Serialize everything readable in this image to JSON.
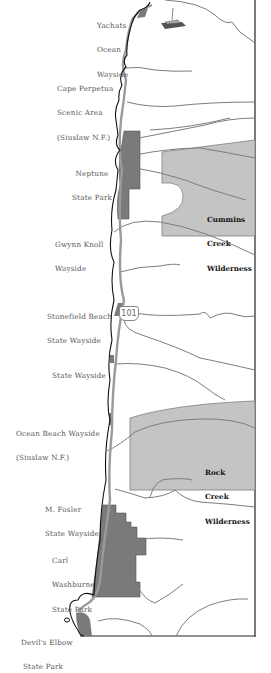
{
  "map": {
    "highway": {
      "route_number": "101"
    },
    "wilderness_areas": [
      {
        "name": "Cummins Creek Wilderness",
        "lines": [
          "Cummins",
          "Creek",
          "Wilderness"
        ]
      },
      {
        "name": "Rock Creek Wilderness",
        "lines": [
          "Rock",
          "Creek",
          "Wilderness"
        ]
      }
    ],
    "labels": [
      {
        "id": "yachats",
        "lines": [
          "Yachats",
          "Ocean",
          "Wayside"
        ]
      },
      {
        "id": "cape-perpetua",
        "lines": [
          "Cape Perpetua",
          "Scenic Area",
          "(Siuslaw N.F.)"
        ]
      },
      {
        "id": "neptune",
        "lines": [
          "Neptune",
          "State Park"
        ]
      },
      {
        "id": "gwynn-knoll",
        "lines": [
          "Gwynn Knoll",
          "Wayside"
        ]
      },
      {
        "id": "stonefield",
        "lines": [
          "Stonefield Beach",
          "State Wayside"
        ]
      },
      {
        "id": "state-wayside",
        "lines": [
          "State Wayside"
        ]
      },
      {
        "id": "ocean-beach",
        "lines": [
          "Ocean Beach Wayside",
          "(Siuslaw N.F.)"
        ]
      },
      {
        "id": "m-fosler",
        "lines": [
          "M. Fosler",
          "State Wayside"
        ]
      },
      {
        "id": "carl-washburne",
        "lines": [
          "Carl",
          "Washburne",
          "State Park"
        ]
      },
      {
        "id": "devils-elbow",
        "lines": [
          "Devil's Elbow",
          "State Park"
        ]
      }
    ],
    "colors": {
      "wilderness_fill": "#c4c4c4",
      "park_fill": "#7a7a7a",
      "road": "#9a9a9a",
      "rivers": "#7d7d7d",
      "coastline": "#111111"
    }
  }
}
